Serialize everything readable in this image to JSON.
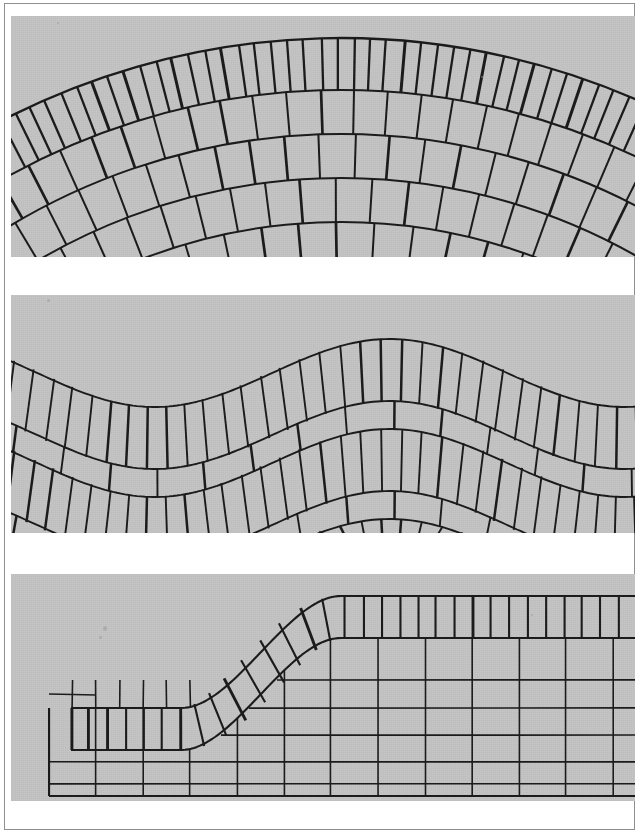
{
  "page": {
    "width": 641,
    "height": 838,
    "background_color": "#ffffff",
    "frame_color": "#8f8f8f",
    "paper_tone": "#ffffff",
    "figure_fill": "#c5c5c5",
    "ink_color": "#1c1c1c",
    "thin_ink_color": "#3a3a3a"
  },
  "figure": {
    "kind": "scanned-plate",
    "panel_count": 3
  },
  "panels": [
    {
      "id": "panel-arch",
      "name": "arch-voussoir-panel",
      "label": "Segmental arch with radial voussoir courses",
      "x": 6,
      "y": 12,
      "width": 624,
      "height": 241,
      "background_color": "#c5c5c5",
      "geometry": {
        "type": "concentric-arcs",
        "center_x": 330,
        "center_y": 760,
        "apex_y": 24,
        "rings": [
          {
            "index": 0,
            "radius": 738,
            "thickness": 52,
            "block_count": 44,
            "stroke_weight": 2.3,
            "note": "outer narrow voussoir ring"
          },
          {
            "index": 1,
            "radius": 686,
            "thickness": 44,
            "block_count": 22,
            "stroke_weight": 2.0,
            "note": "second course, wider blocks"
          },
          {
            "index": 2,
            "radius": 642,
            "thickness": 44,
            "block_count": 21,
            "stroke_weight": 2.0,
            "offset": 0.5
          },
          {
            "index": 3,
            "radius": 598,
            "thickness": 44,
            "block_count": 21,
            "stroke_weight": 2.0,
            "offset": 0.0
          },
          {
            "index": 4,
            "radius": 554,
            "thickness": 44,
            "block_count": 20,
            "stroke_weight": 2.0,
            "offset": 0.5
          },
          {
            "index": 5,
            "radius": 510,
            "thickness": 46,
            "block_count": 20,
            "stroke_weight": 2.0,
            "offset": 0.0
          }
        ]
      }
    },
    {
      "id": "panel-wave",
      "name": "wave-course-panel",
      "label": "Sinusoidal banded coursing with alternating tall and flat courses",
      "x": 6,
      "y": 291,
      "width": 624,
      "height": 238,
      "background_color": "#c5c5c5",
      "geometry": {
        "type": "sine-bands",
        "amplitude": 34,
        "wavelength": 470,
        "phase": -0.35,
        "baseline_top": 78,
        "courses": [
          {
            "index": 0,
            "kind": "tall",
            "height": 62,
            "block_count": 34,
            "stroke_weight": 1.9
          },
          {
            "index": 1,
            "kind": "flat",
            "height": 28,
            "block_count": 14,
            "stroke_weight": 1.9
          },
          {
            "index": 2,
            "kind": "tall",
            "height": 62,
            "block_count": 34,
            "stroke_weight": 1.9
          },
          {
            "index": 3,
            "kind": "flat",
            "height": 28,
            "block_count": 14,
            "stroke_weight": 1.9
          },
          {
            "index": 4,
            "kind": "tall",
            "height": 58,
            "block_count": 34,
            "stroke_weight": 1.9
          }
        ]
      }
    },
    {
      "id": "panel-ramp",
      "name": "ramp-s-curve-panel",
      "label": "Stepped wall with S-curved capping band of tapered blocks over a rectangular grid",
      "x": 6,
      "y": 570,
      "width": 624,
      "height": 227,
      "background_color": "#c5c5c5",
      "geometry": {
        "type": "s-curve-cap-over-grid",
        "curve": {
          "x_start": 60,
          "x_rise_start": 170,
          "x_rise_end": 330,
          "x_end": 624,
          "y_low": 134,
          "y_high": 22,
          "band_thickness": 42,
          "block_count": 31,
          "stroke_weight": 2.1
        },
        "grid": {
          "left": 38,
          "right": 624,
          "bottom": 222,
          "column_pitch": 47,
          "row_lines_y": [
            106,
            134,
            161,
            188,
            210
          ],
          "stroke_weight": 1.6,
          "note": "lower wall of rectangular blocks; left-hand short course has an extra horizontal split"
        }
      }
    }
  ],
  "gaps": [
    {
      "name": "gap-after-panel-1",
      "top": 253,
      "height": 38,
      "color": "#ffffff"
    },
    {
      "name": "gap-after-panel-2",
      "top": 529,
      "height": 41,
      "color": "#ffffff"
    },
    {
      "name": "gap-after-panel-3",
      "top": 797,
      "height": 31,
      "color": "#ffffff"
    }
  ]
}
